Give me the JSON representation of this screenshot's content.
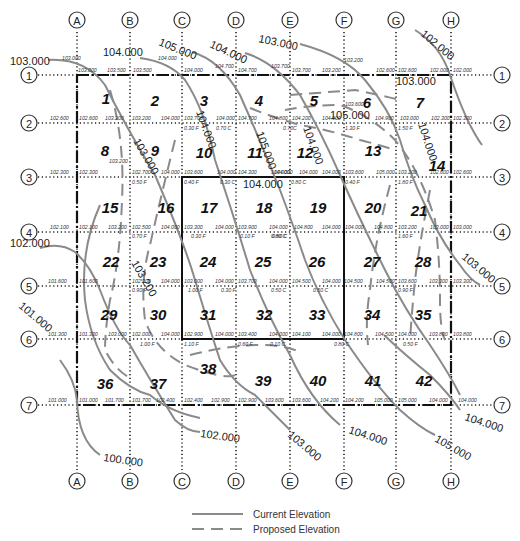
{
  "columns": [
    {
      "label": "A",
      "x": 77
    },
    {
      "label": "B",
      "x": 130
    },
    {
      "label": "C",
      "x": 182
    },
    {
      "label": "D",
      "x": 236
    },
    {
      "label": "E",
      "x": 290
    },
    {
      "label": "F",
      "x": 344
    },
    {
      "label": "G",
      "x": 396
    },
    {
      "label": "H",
      "x": 451
    }
  ],
  "rows": [
    {
      "label": "1",
      "y": 75
    },
    {
      "label": "2",
      "y": 123
    },
    {
      "label": "3",
      "y": 177
    },
    {
      "label": "4",
      "y": 232
    },
    {
      "label": "5",
      "y": 286
    },
    {
      "label": "6",
      "y": 339
    },
    {
      "label": "7",
      "y": 405
    }
  ],
  "cells": [
    {
      "n": "1",
      "x": 106,
      "y": 98
    },
    {
      "n": "2",
      "x": 155,
      "y": 100
    },
    {
      "n": "3",
      "x": 204,
      "y": 100
    },
    {
      "n": "4",
      "x": 259,
      "y": 100
    },
    {
      "n": "5",
      "x": 314,
      "y": 100
    },
    {
      "n": "6",
      "x": 367,
      "y": 102
    },
    {
      "n": "7",
      "x": 420,
      "y": 102
    },
    {
      "n": "8",
      "x": 105,
      "y": 150
    },
    {
      "n": "9",
      "x": 155,
      "y": 150
    },
    {
      "n": "10",
      "x": 204,
      "y": 152
    },
    {
      "n": "11",
      "x": 255,
      "y": 152
    },
    {
      "n": "12",
      "x": 305,
      "y": 152
    },
    {
      "n": "13",
      "x": 373,
      "y": 150
    },
    {
      "n": "14",
      "x": 437,
      "y": 165
    },
    {
      "n": "15",
      "x": 110,
      "y": 207
    },
    {
      "n": "16",
      "x": 166,
      "y": 207
    },
    {
      "n": "17",
      "x": 209,
      "y": 207
    },
    {
      "n": "18",
      "x": 264,
      "y": 207
    },
    {
      "n": "19",
      "x": 318,
      "y": 207
    },
    {
      "n": "20",
      "x": 373,
      "y": 207
    },
    {
      "n": "21",
      "x": 419,
      "y": 210
    },
    {
      "n": "22",
      "x": 111,
      "y": 261
    },
    {
      "n": "23",
      "x": 158,
      "y": 261
    },
    {
      "n": "24",
      "x": 208,
      "y": 261
    },
    {
      "n": "25",
      "x": 263,
      "y": 261
    },
    {
      "n": "26",
      "x": 317,
      "y": 261
    },
    {
      "n": "27",
      "x": 372,
      "y": 261
    },
    {
      "n": "28",
      "x": 423,
      "y": 261
    },
    {
      "n": "29",
      "x": 109,
      "y": 314
    },
    {
      "n": "30",
      "x": 158,
      "y": 314
    },
    {
      "n": "31",
      "x": 208,
      "y": 314
    },
    {
      "n": "32",
      "x": 264,
      "y": 314
    },
    {
      "n": "33",
      "x": 317,
      "y": 314
    },
    {
      "n": "34",
      "x": 372,
      "y": 314
    },
    {
      "n": "35",
      "x": 423,
      "y": 314
    },
    {
      "n": "36",
      "x": 105,
      "y": 383
    },
    {
      "n": "37",
      "x": 158,
      "y": 383
    },
    {
      "n": "38",
      "x": 208,
      "y": 368
    },
    {
      "n": "39",
      "x": 263,
      "y": 380
    },
    {
      "n": "40",
      "x": 318,
      "y": 380
    },
    {
      "n": "41",
      "x": 373,
      "y": 380
    },
    {
      "n": "42",
      "x": 424,
      "y": 380
    }
  ],
  "grid_elevations": [
    {
      "t": "103.000",
      "x": 62,
      "y": 60
    },
    {
      "t": "103.000",
      "x": 78,
      "y": 72
    },
    {
      "t": "103.500",
      "x": 107,
      "y": 72
    },
    {
      "t": "103.500",
      "x": 133,
      "y": 72
    },
    {
      "t": "104.000",
      "x": 158,
      "y": 60
    },
    {
      "t": "104.000",
      "x": 184,
      "y": 72
    },
    {
      "t": "104.700",
      "x": 215,
      "y": 68
    },
    {
      "t": "104.700",
      "x": 238,
      "y": 72
    },
    {
      "t": "103.700",
      "x": 271,
      "y": 68
    },
    {
      "t": "103.700",
      "x": 292,
      "y": 72
    },
    {
      "t": "103.200",
      "x": 322,
      "y": 72
    },
    {
      "t": "103.200",
      "x": 344,
      "y": 62
    },
    {
      "t": "102.600",
      "x": 376,
      "y": 72
    },
    {
      "t": "102.600",
      "x": 398,
      "y": 72
    },
    {
      "t": "102.000",
      "x": 430,
      "y": 72
    },
    {
      "t": "102.000",
      "x": 453,
      "y": 72
    },
    {
      "t": "102.600",
      "x": 50,
      "y": 120
    },
    {
      "t": "102.600",
      "x": 79,
      "y": 120
    },
    {
      "t": "103.200",
      "x": 105,
      "y": 120
    },
    {
      "t": "103.200",
      "x": 132,
      "y": 120
    },
    {
      "t": "104.000",
      "x": 161,
      "y": 120
    },
    {
      "t": "103.700",
      "x": 184,
      "y": 120
    },
    {
      "t": "104.000",
      "x": 216,
      "y": 120
    },
    {
      "t": "104.700",
      "x": 238,
      "y": 120
    },
    {
      "t": "104.800",
      "x": 269,
      "y": 120
    },
    {
      "t": "104.200",
      "x": 292,
      "y": 120
    },
    {
      "t": "104.900",
      "x": 322,
      "y": 120
    },
    {
      "t": "103.600",
      "x": 345,
      "y": 106
    },
    {
      "t": "104.900",
      "x": 375,
      "y": 120
    },
    {
      "t": "103.000",
      "x": 400,
      "y": 120
    },
    {
      "t": "102.300",
      "x": 431,
      "y": 120
    },
    {
      "t": "102.300",
      "x": 453,
      "y": 120
    },
    {
      "t": "103.200",
      "x": 109,
      "y": 163
    },
    {
      "t": "102.300",
      "x": 50,
      "y": 174
    },
    {
      "t": "102.300",
      "x": 79,
      "y": 174
    },
    {
      "t": "102.700",
      "x": 132,
      "y": 174
    },
    {
      "t": "104.000",
      "x": 161,
      "y": 174
    },
    {
      "t": "103.600",
      "x": 184,
      "y": 174
    },
    {
      "t": "104.000",
      "x": 217,
      "y": 174
    },
    {
      "t": "104.300",
      "x": 238,
      "y": 174
    },
    {
      "t": "104.000",
      "x": 271,
      "y": 174
    },
    {
      "t": "104.000",
      "x": 274,
      "y": 174
    },
    {
      "t": "104.000",
      "x": 299,
      "y": 174
    },
    {
      "t": "104.000",
      "x": 322,
      "y": 174
    },
    {
      "t": "103.600",
      "x": 345,
      "y": 174
    },
    {
      "t": "105.000",
      "x": 376,
      "y": 174
    },
    {
      "t": "103.200",
      "x": 398,
      "y": 174
    },
    {
      "t": "102.600",
      "x": 430,
      "y": 174
    },
    {
      "t": "102.600",
      "x": 453,
      "y": 174
    },
    {
      "t": "102.100",
      "x": 50,
      "y": 229
    },
    {
      "t": "102.100",
      "x": 79,
      "y": 229
    },
    {
      "t": "103.200",
      "x": 108,
      "y": 229
    },
    {
      "t": "102.500",
      "x": 132,
      "y": 229
    },
    {
      "t": "104.000",
      "x": 161,
      "y": 229
    },
    {
      "t": "103.300",
      "x": 184,
      "y": 229
    },
    {
      "t": "104.000",
      "x": 215,
      "y": 229
    },
    {
      "t": "103.900",
      "x": 238,
      "y": 229
    },
    {
      "t": "104.000",
      "x": 269,
      "y": 229
    },
    {
      "t": "104.800",
      "x": 294,
      "y": 229
    },
    {
      "t": "104.000",
      "x": 322,
      "y": 229
    },
    {
      "t": "104.000",
      "x": 345,
      "y": 229
    },
    {
      "t": "104.800",
      "x": 374,
      "y": 229
    },
    {
      "t": "103.200",
      "x": 398,
      "y": 229
    },
    {
      "t": "103.000",
      "x": 430,
      "y": 229
    },
    {
      "t": "103.000",
      "x": 453,
      "y": 229
    },
    {
      "t": "101.600",
      "x": 48,
      "y": 283
    },
    {
      "t": "101.600",
      "x": 79,
      "y": 283
    },
    {
      "t": "102.300",
      "x": 132,
      "y": 283
    },
    {
      "t": "104.000",
      "x": 161,
      "y": 283
    },
    {
      "t": "103.000",
      "x": 184,
      "y": 283
    },
    {
      "t": "104.000",
      "x": 215,
      "y": 283
    },
    {
      "t": "103.700",
      "x": 238,
      "y": 283
    },
    {
      "t": "104.000",
      "x": 269,
      "y": 283
    },
    {
      "t": "104.500",
      "x": 292,
      "y": 283
    },
    {
      "t": "104.000",
      "x": 322,
      "y": 283
    },
    {
      "t": "104.500",
      "x": 344,
      "y": 283
    },
    {
      "t": "104.500",
      "x": 376,
      "y": 283
    },
    {
      "t": "103.600",
      "x": 398,
      "y": 283
    },
    {
      "t": "103.300",
      "x": 429,
      "y": 283
    },
    {
      "t": "103.300",
      "x": 453,
      "y": 283
    },
    {
      "t": "101.300",
      "x": 48,
      "y": 336
    },
    {
      "t": "101.300",
      "x": 79,
      "y": 336
    },
    {
      "t": "103.000",
      "x": 108,
      "y": 336
    },
    {
      "t": "102.000",
      "x": 132,
      "y": 336
    },
    {
      "t": "104.000",
      "x": 161,
      "y": 336
    },
    {
      "t": "102.900",
      "x": 184,
      "y": 336
    },
    {
      "t": "104.000",
      "x": 215,
      "y": 336
    },
    {
      "t": "103.400",
      "x": 238,
      "y": 336
    },
    {
      "t": "104.000",
      "x": 269,
      "y": 336
    },
    {
      "t": "104.100",
      "x": 292,
      "y": 336
    },
    {
      "t": "104.000",
      "x": 322,
      "y": 336
    },
    {
      "t": "104.800",
      "x": 344,
      "y": 336
    },
    {
      "t": "104.500",
      "x": 375,
      "y": 336
    },
    {
      "t": "104.000",
      "x": 398,
      "y": 336
    },
    {
      "t": "103.800",
      "x": 429,
      "y": 336
    },
    {
      "t": "103.800",
      "x": 453,
      "y": 336
    },
    {
      "t": "101.000",
      "x": 48,
      "y": 402
    },
    {
      "t": "101.000",
      "x": 79,
      "y": 402
    },
    {
      "t": "101.700",
      "x": 105,
      "y": 402
    },
    {
      "t": "101.700",
      "x": 132,
      "y": 402
    },
    {
      "t": "102.400",
      "x": 156,
      "y": 402
    },
    {
      "t": "102.400",
      "x": 184,
      "y": 402
    },
    {
      "t": "102.900",
      "x": 211,
      "y": 402
    },
    {
      "t": "102.900",
      "x": 238,
      "y": 402
    },
    {
      "t": "103.600",
      "x": 265,
      "y": 402
    },
    {
      "t": "103.600",
      "x": 292,
      "y": 402
    },
    {
      "t": "104.200",
      "x": 320,
      "y": 402
    },
    {
      "t": "104.200",
      "x": 345,
      "y": 402
    },
    {
      "t": "105.000",
      "x": 374,
      "y": 402
    },
    {
      "t": "105.000",
      "x": 398,
      "y": 402
    },
    {
      "t": "104.000",
      "x": 429,
      "y": 402
    },
    {
      "t": "104.000",
      "x": 458,
      "y": 402
    }
  ],
  "cut_fill": [
    {
      "t": "0.30 F",
      "x": 184,
      "y": 130
    },
    {
      "t": "0.70 C",
      "x": 216,
      "y": 130
    },
    {
      "t": "0.70C",
      "x": 283,
      "y": 130
    },
    {
      "t": "1.30 F",
      "x": 345,
      "y": 130
    },
    {
      "t": "1.50 F",
      "x": 398,
      "y": 130
    },
    {
      "t": "0.50 F",
      "x": 132,
      "y": 184
    },
    {
      "t": "0.40 F",
      "x": 184,
      "y": 184
    },
    {
      "t": "0.30 C",
      "x": 220,
      "y": 184
    },
    {
      "t": "0.80 C",
      "x": 291,
      "y": 184
    },
    {
      "t": "0.40 F",
      "x": 345,
      "y": 184
    },
    {
      "t": "1.80 F",
      "x": 398,
      "y": 184
    },
    {
      "t": "0.70 F",
      "x": 132,
      "y": 238
    },
    {
      "t": "0.30 F",
      "x": 191,
      "y": 238
    },
    {
      "t": "0.10 F",
      "x": 240,
      "y": 238
    },
    {
      "t": "0.80 C",
      "x": 271,
      "y": 238
    },
    {
      "t": "0.80 C",
      "x": 272,
      "y": 238
    },
    {
      "t": "1.60 F",
      "x": 398,
      "y": 238
    },
    {
      "t": "0.90 F",
      "x": 132,
      "y": 292
    },
    {
      "t": "1.00 F",
      "x": 188,
      "y": 292
    },
    {
      "t": "0.30 F",
      "x": 221,
      "y": 292
    },
    {
      "t": "0.50 C",
      "x": 271,
      "y": 292
    },
    {
      "t": "0.50 C",
      "x": 313,
      "y": 292
    },
    {
      "t": "0.90 F",
      "x": 398,
      "y": 292
    },
    {
      "t": "1.00 F",
      "x": 140,
      "y": 346
    },
    {
      "t": "1.10 F",
      "x": 184,
      "y": 346
    },
    {
      "t": "0.60 F",
      "x": 238,
      "y": 346
    },
    {
      "t": "0.10 C",
      "x": 270,
      "y": 346
    },
    {
      "t": "0.80 C",
      "x": 334,
      "y": 346
    },
    {
      "t": "0.50 F",
      "x": 403,
      "y": 346
    }
  ],
  "contour_labels": [
    {
      "t": "103.000",
      "x": 10,
      "y": 65,
      "r": 0
    },
    {
      "t": "104.000",
      "x": 103,
      "y": 56,
      "r": 0
    },
    {
      "t": "105.000",
      "x": 158,
      "y": 45,
      "r": 22
    },
    {
      "t": "104.000",
      "x": 209,
      "y": 47,
      "r": 25
    },
    {
      "t": "103.000",
      "x": 258,
      "y": 42,
      "r": 12
    },
    {
      "t": "102.000",
      "x": 420,
      "y": 35,
      "r": 40
    },
    {
      "t": "103.000",
      "x": 396,
      "y": 85,
      "r": 0
    },
    {
      "t": "105.000",
      "x": 330,
      "y": 119,
      "r": 0
    },
    {
      "t": "104.000",
      "x": 196,
      "y": 112,
      "r": 70
    },
    {
      "t": "105.000",
      "x": 256,
      "y": 133,
      "r": 70
    },
    {
      "t": "104.000",
      "x": 303,
      "y": 128,
      "r": 70
    },
    {
      "t": "103.000",
      "x": 133,
      "y": 141,
      "r": 60
    },
    {
      "t": "104.000",
      "x": 418,
      "y": 124,
      "r": 72
    },
    {
      "t": "104.000",
      "x": 243,
      "y": 188,
      "r": 0
    },
    {
      "t": "102.000",
      "x": 10,
      "y": 247,
      "r": 0
    },
    {
      "t": "101.000",
      "x": 18,
      "y": 307,
      "r": 40
    },
    {
      "t": "103.000",
      "x": 461,
      "y": 258,
      "r": 40
    },
    {
      "t": "102.000",
      "x": 200,
      "y": 437,
      "r": 8
    },
    {
      "t": "100.000",
      "x": 103,
      "y": 461,
      "r": 8
    },
    {
      "t": "103.000",
      "x": 287,
      "y": 436,
      "r": 40
    },
    {
      "t": "104.000",
      "x": 348,
      "y": 433,
      "r": 18
    },
    {
      "t": "105.000",
      "x": 434,
      "y": 441,
      "r": 30
    },
    {
      "t": "104.000",
      "x": 464,
      "y": 420,
      "r": 18
    },
    {
      "t": "103.200",
      "x": 131,
      "y": 263,
      "r": 60
    }
  ],
  "legend": {
    "current": "Current Elevation",
    "proposed": "Proposed Elevation",
    "current_color": "#8a8a8a",
    "proposed_color": "#8a8a8a"
  }
}
